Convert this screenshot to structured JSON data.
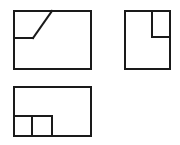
{
  "document": {
    "title": "Orthographic Projection Views",
    "background_color": "#ffffff",
    "line_color": "#1a1a1a",
    "fill_color": "#ffffff",
    "line_width": 2,
    "canvas": {
      "width": 180,
      "height": 145
    }
  },
  "chart_data": {
    "type": "diagram",
    "xlabel": "",
    "ylabel": "",
    "views": [
      {
        "name": "front-view",
        "label": "Front View",
        "position": "top-left",
        "outline": {
          "x": 14,
          "y": 11,
          "width": 77,
          "height": 58
        },
        "interior_edges": [
          {
            "name": "horizontal-step-edge",
            "x1": 14,
            "y1": 38,
            "x2": 33,
            "y2": 38
          },
          {
            "name": "diagonal-chamfer-edge",
            "x1": 33,
            "y1": 38,
            "x2": 52,
            "y2": 11
          }
        ]
      },
      {
        "name": "side-view",
        "label": "Side View",
        "position": "top-right",
        "outline": {
          "x": 125,
          "y": 11,
          "width": 45,
          "height": 58
        },
        "interior_edges": [
          {
            "name": "notch-vertical-edge",
            "x1": 152,
            "y1": 11,
            "x2": 152,
            "y2": 37
          },
          {
            "name": "notch-horizontal-edge",
            "x1": 152,
            "y1": 37,
            "x2": 170,
            "y2": 37
          }
        ]
      },
      {
        "name": "top-view",
        "label": "Top View",
        "position": "bottom-left",
        "outline": {
          "x": 14,
          "y": 87,
          "width": 77,
          "height": 49
        },
        "interior_edges": [
          {
            "name": "slot-horizontal-edge",
            "x1": 14,
            "y1": 116,
            "x2": 52,
            "y2": 116
          },
          {
            "name": "slot-left-vertical-edge",
            "x1": 32,
            "y1": 116,
            "x2": 32,
            "y2": 136
          },
          {
            "name": "slot-right-vertical-edge",
            "x1": 52,
            "y1": 116,
            "x2": 52,
            "y2": 136
          }
        ]
      }
    ]
  }
}
